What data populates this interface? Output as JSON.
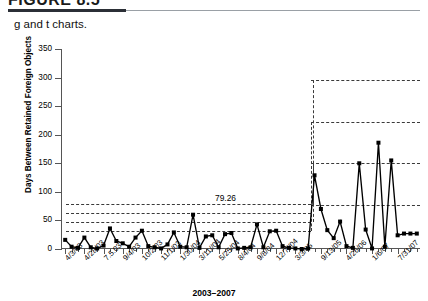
{
  "figure": {
    "number_label": "FIGURE 8.5",
    "caption": "g and t charts."
  },
  "chart_data": {
    "type": "line",
    "title": "",
    "xlabel": "2003–2007",
    "ylabel": "Days Between Retained Foreign Objects",
    "ylim": [
      0,
      350
    ],
    "yticks": [
      0,
      50,
      100,
      150,
      200,
      250,
      300,
      350
    ],
    "grid": false,
    "legend": "none",
    "annotations": [
      {
        "text": "79.26",
        "value": 79.26,
        "phase": "before"
      }
    ],
    "phases": [
      {
        "name": "before",
        "start_index": 0,
        "end_index": 38,
        "center_line": 47,
        "limits": [
          31,
          47,
          63,
          79.26
        ]
      },
      {
        "name": "after",
        "start_index": 39,
        "end_index": 55,
        "center_line": 150,
        "limits": [
          77,
          150,
          222,
          295
        ]
      }
    ],
    "xtick_labels": [
      "4/3/03",
      "4/28/03",
      "7.5.03",
      "9/4/03",
      "10/2/03",
      "11/1/03",
      "1/30/04",
      "3/11//04",
      "5/25/04",
      "8/4/04",
      "9/8/04",
      "12/7//04",
      "3/3/05",
      "9/13/05",
      "4/26/06",
      "1/6/07",
      "7/31/07"
    ],
    "xtick_label_indices": [
      0,
      3,
      6,
      9,
      12,
      15,
      18,
      21,
      24,
      27,
      30,
      33,
      36,
      40,
      44,
      48,
      52
    ],
    "values": [
      16,
      4,
      2,
      20,
      3,
      1,
      6,
      36,
      14,
      10,
      4,
      20,
      32,
      5,
      3,
      1,
      8,
      29,
      4,
      3,
      60,
      2,
      22,
      24,
      3,
      26,
      28,
      1,
      2,
      3,
      43,
      3,
      31,
      32,
      5,
      2,
      1,
      0,
      1,
      129,
      70,
      33,
      19,
      48,
      5,
      2,
      150,
      34,
      1,
      186,
      4,
      155,
      24,
      27,
      27,
      27
    ]
  }
}
